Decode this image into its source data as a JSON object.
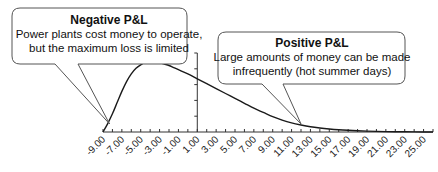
{
  "chart_data": {
    "type": "line",
    "title": "",
    "xlabel": "",
    "ylabel": "",
    "xlim": [
      -9,
      26
    ],
    "ylim": [
      0,
      1
    ],
    "grid": false,
    "legend": "none",
    "x_tick_labels": [
      "-9.00",
      "-7.00",
      "-5.00",
      "-3.00",
      "-1.00",
      "1.00",
      "3.00",
      "5.00",
      "7.00",
      "9.00",
      "11.00",
      "13.00",
      "15.00",
      "17.00",
      "19.00",
      "21.00",
      "23.00",
      "25.00"
    ],
    "y_axis_at_x": 1,
    "series": [
      {
        "name": "P&L distribution",
        "x": [
          -9,
          -8.5,
          -8,
          -7.5,
          -7,
          -6.5,
          -6,
          -5.5,
          -5,
          -4.5,
          -4,
          -3.5,
          -3,
          -2.5,
          -2,
          -1.5,
          -1,
          0,
          1,
          2,
          3,
          4,
          5,
          6,
          7,
          8,
          9,
          10,
          11,
          12,
          13,
          14,
          15,
          16,
          17,
          18,
          19,
          20,
          21,
          22,
          23,
          24,
          25,
          26
        ],
        "y": [
          0,
          0.12,
          0.26,
          0.42,
          0.58,
          0.72,
          0.83,
          0.91,
          0.96,
          0.99,
          1.0,
          1.0,
          0.99,
          0.97,
          0.95,
          0.92,
          0.89,
          0.83,
          0.76,
          0.69,
          0.62,
          0.55,
          0.48,
          0.41,
          0.34,
          0.28,
          0.22,
          0.17,
          0.13,
          0.1,
          0.075,
          0.057,
          0.043,
          0.032,
          0.024,
          0.018,
          0.013,
          0.009,
          0.006,
          0.004,
          0.003,
          0.002,
          0.001,
          0.0
        ]
      }
    ],
    "annotations": [
      {
        "id": "negative",
        "title": "Negative P&L",
        "lines": [
          "Power plants cost money to operate,",
          "but the maximum loss is limited"
        ],
        "points_to_x": -9
      },
      {
        "id": "positive",
        "title": "Positive P&L",
        "lines": [
          "Large amounts of money can be made",
          "infrequently (hot summer days)"
        ],
        "points_to_x": 12
      }
    ]
  },
  "colors": {
    "line": "#1a1a1a",
    "axis": "#333333",
    "callout_border": "#555555",
    "text": "#111111"
  }
}
